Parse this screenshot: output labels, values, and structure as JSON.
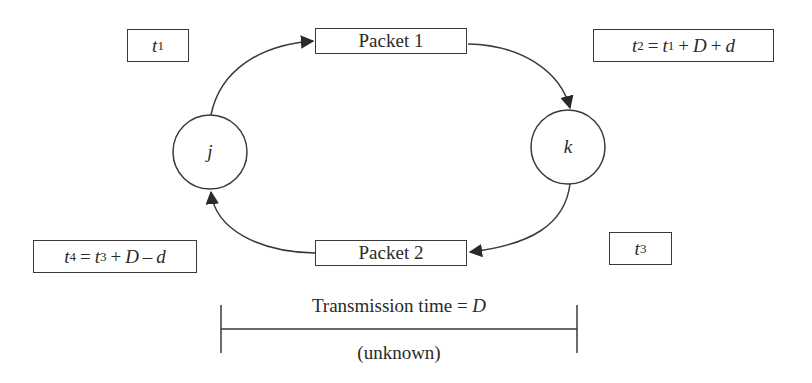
{
  "diagram": {
    "nodes": [
      {
        "id": "j",
        "label": "j"
      },
      {
        "id": "k",
        "label": "k"
      }
    ],
    "packets": [
      {
        "id": "packet1",
        "label": "Packet 1"
      },
      {
        "id": "packet2",
        "label": "Packet 2"
      }
    ],
    "timestamps": {
      "t1": {
        "var": "t",
        "sub": "1"
      },
      "t2": {
        "lhs_var": "t",
        "lhs_sub": "2",
        "eq": "=",
        "a_var": "t",
        "a_sub": "1",
        "op1": "+",
        "b": "D",
        "op2": "+",
        "c": "d"
      },
      "t3": {
        "var": "t",
        "sub": "3"
      },
      "t4": {
        "lhs_var": "t",
        "lhs_sub": "4",
        "eq": "=",
        "a_var": "t",
        "a_sub": "3",
        "op1": "+",
        "b": "D",
        "op2": "–",
        "c": "d"
      }
    },
    "edges": [
      {
        "from": "j",
        "to": "packet1"
      },
      {
        "from": "packet1",
        "to": "k"
      },
      {
        "from": "k",
        "to": "packet2"
      },
      {
        "from": "packet2",
        "to": "j"
      }
    ],
    "transmission": {
      "label": "Transmission time = ",
      "var": "D",
      "note": "(unknown)"
    },
    "colors": {
      "stroke": "#3a3a3a",
      "text": "#2a2a2a",
      "background": "#ffffff"
    }
  }
}
